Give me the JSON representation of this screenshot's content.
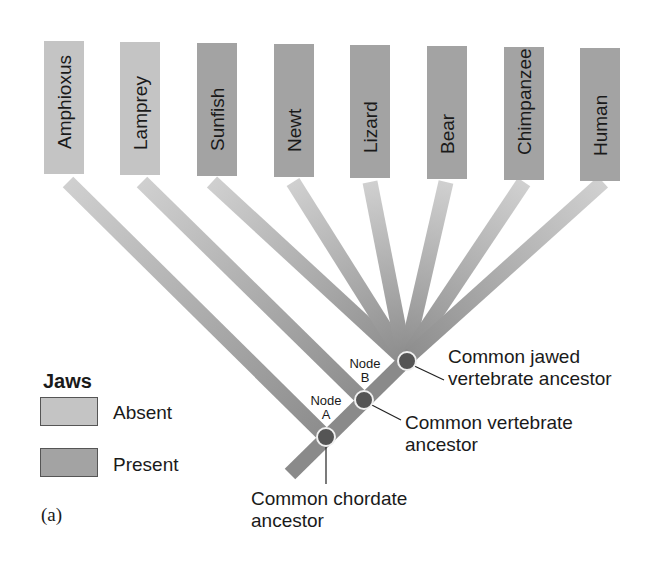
{
  "diagram": {
    "type": "cladogram",
    "trait": "Jaws",
    "colors": {
      "jaws_absent": "#c4c4c4",
      "jaws_present": "#a3a3a3",
      "branch_dark": "#8a8a8a",
      "node_fill": "#555555",
      "node_ring": "#f0f0f0"
    },
    "taxa": [
      {
        "name": "Amphioxus",
        "jaws": "absent"
      },
      {
        "name": "Lamprey",
        "jaws": "absent"
      },
      {
        "name": "Sunfish",
        "jaws": "present"
      },
      {
        "name": "Newt",
        "jaws": "present"
      },
      {
        "name": "Lizard",
        "jaws": "present"
      },
      {
        "name": "Bear",
        "jaws": "present"
      },
      {
        "name": "Chimpanzee",
        "jaws": "present"
      },
      {
        "name": "Human",
        "jaws": "present"
      }
    ],
    "nodes": [
      {
        "id": "A",
        "label_line1": "Node",
        "label_line2": "A",
        "annotation_line1": "Common chordate",
        "annotation_line2": "ancestor"
      },
      {
        "id": "B",
        "label_line1": "Node",
        "label_line2": "B",
        "annotation_line1": "Common vertebrate",
        "annotation_line2": "ancestor"
      },
      {
        "id": "C",
        "annotation_line1": "Common jawed",
        "annotation_line2": "vertebrate ancestor"
      }
    ],
    "legend": {
      "title": "Jaws",
      "items": [
        {
          "label": "Absent",
          "color": "#c4c4c4"
        },
        {
          "label": "Present",
          "color": "#a3a3a3"
        }
      ]
    },
    "figure_label": "(a)"
  }
}
